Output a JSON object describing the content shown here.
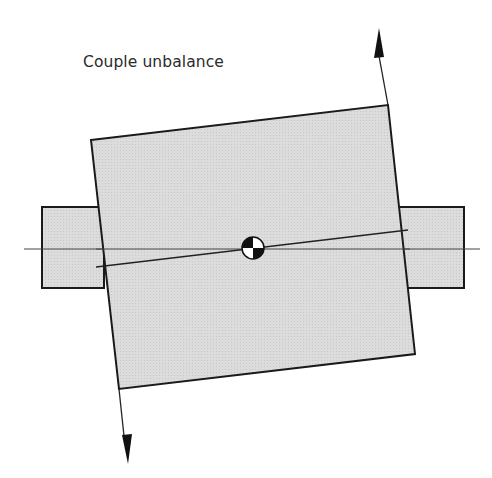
{
  "title": "Couple unbalance",
  "colors": {
    "fill": "#d9d9d9",
    "stroke": "#1a1a1a",
    "axis": "#444444",
    "background": "#ffffff"
  },
  "shapes": {
    "left_shaft": {
      "x": 42,
      "y": 207,
      "w": 62,
      "h": 81
    },
    "right_shaft": {
      "x": 398,
      "y": 207,
      "w": 66,
      "h": 81
    },
    "rotor_disk": {
      "corners": [
        [
          91,
          140
        ],
        [
          388,
          105
        ],
        [
          415,
          354
        ],
        [
          119,
          389
        ]
      ]
    },
    "rotation_axis": {
      "x1": 24,
      "y1": 249,
      "x2": 480,
      "y2": 249
    },
    "principal_axis": {
      "x1": 96,
      "y1": 267,
      "x2": 408,
      "y2": 230
    },
    "center_of_mass": {
      "cx": 253,
      "cy": 248,
      "r": 11
    },
    "force_arrow_up": {
      "x1": 388,
      "y1": 105,
      "x2": 379,
      "y2": 28
    },
    "force_arrow_down": {
      "x1": 119,
      "y1": 389,
      "x2": 128,
      "y2": 464
    }
  }
}
